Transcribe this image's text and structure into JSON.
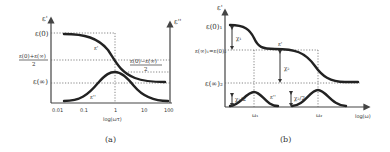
{
  "figure": {
    "panel_a": {
      "caption": "(a)",
      "y_axis_left_label": "ε'",
      "y_axis_right_label": "ε''",
      "x_axis_label": "log(ωτ)",
      "x_ticks": [
        "0.01",
        "0.1",
        "1",
        "10",
        "100"
      ],
      "left_labels": {
        "eps0": "ε(0)",
        "mid_num": "ε(0)+ε(∞)",
        "mid_den": "2",
        "epsinf": "ε(∞)"
      },
      "right_label_num": "ε(0)−ε(∞)",
      "right_label_den": "2",
      "curve_real_label": "ε'",
      "curve_imag_label": "ε''"
    },
    "panel_b": {
      "caption": "(b)",
      "y_axis_label": "ε'",
      "x_axis_label": "log(ω)",
      "left_labels": {
        "eps0": "ε(0)₁",
        "mid": "ε(∞)₁=ε(0)₂",
        "epsinf": "ε(∞)₂"
      },
      "chi1": "χ₁",
      "chi2": "χ₂",
      "chi1_half": "χ₁/2",
      "chi2_half": "χ₂/2",
      "curve_real_label": "ε'",
      "curve_imag_label": "ε''",
      "omega1": "ω₁",
      "omega2": "ω₂"
    }
  }
}
